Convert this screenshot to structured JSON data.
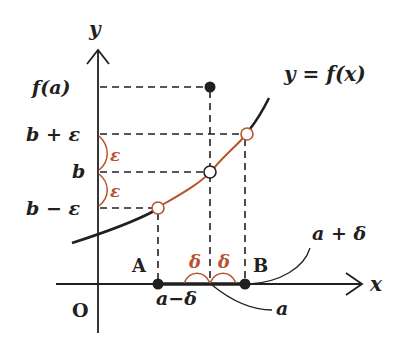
{
  "diagram": {
    "axes": {
      "x_label": "x",
      "y_label": "y",
      "origin_label": "O"
    },
    "y_labels": {
      "fa": "f(a)",
      "b_plus_eps": "b + ε",
      "b": "b",
      "b_minus_eps": "b − ε"
    },
    "x_labels": {
      "a_minus_delta": "a−δ",
      "a": "a",
      "a_plus_delta": "a + δ"
    },
    "points": {
      "A": "A",
      "B": "B"
    },
    "curve_label": "y = f(x)",
    "epsilon": "ε",
    "delta": "δ",
    "colors": {
      "ink": "#231f20",
      "accent": "#b8532e",
      "background": "#ffffff"
    }
  }
}
